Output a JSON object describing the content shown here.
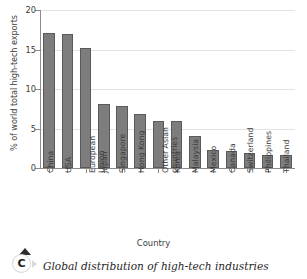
{
  "chart_data": {
    "type": "bar",
    "title": "",
    "xlabel": "Country",
    "ylabel": "% of world total high-tech exports",
    "ylim": [
      0,
      20
    ],
    "yticks": [
      0,
      5,
      10,
      15,
      20
    ],
    "grid": true,
    "legend": "none",
    "bar_color": "#7d7d7d",
    "bar_edge_color": "#5a5a5a",
    "categories": [
      "China",
      "USA",
      "European\nUnion",
      "Japan",
      "Singapore",
      "Hong Kong",
      "Other Asian\ncountries",
      "Korea",
      "Malaysia",
      "Mexico",
      "Canada",
      "Switzerland",
      "Philippines",
      "Thailand"
    ],
    "values": [
      17.1,
      17.0,
      15.2,
      8.1,
      7.8,
      6.9,
      6.0,
      5.9,
      4.0,
      2.3,
      2.1,
      1.9,
      1.7,
      1.7
    ]
  },
  "caption": {
    "badge_letter": "C",
    "text": "Global distribution of high-tech industries"
  }
}
